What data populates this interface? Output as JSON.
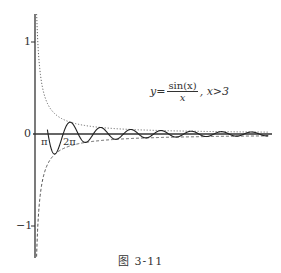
{
  "chart_data": {
    "type": "line",
    "title": "",
    "caption": "图 3-11",
    "annotation": {
      "lhs": "y=",
      "numerator": "sin(x)",
      "denominator": "x",
      "condition": ", x>3"
    },
    "xlabel": "",
    "ylabel": "",
    "y_ticks": [
      "1",
      "0",
      "−1"
    ],
    "x_ticks": [
      "π",
      "2π"
    ],
    "ylim": [
      -1.35,
      1.3
    ],
    "xlim": [
      0,
      49
    ],
    "grid": false,
    "series": [
      {
        "name": "y = sin(x)/x, x>3",
        "style": "solid",
        "x_range": [
          3,
          49
        ]
      },
      {
        "name": "y = 1/x",
        "style": "dotted",
        "x_range": [
          0.75,
          49
        ]
      },
      {
        "name": "y = -1/x",
        "style": "dashed",
        "x_range": [
          0.75,
          49
        ]
      }
    ]
  },
  "labels": {
    "y1": "1",
    "y0": "0",
    "ym1": "−1",
    "pi": "π",
    "two_pi": "2π",
    "caption": "图   3-11",
    "f_lhs": "y=",
    "f_num": "sin(x)",
    "f_den": "x",
    "f_cond": ", x>3"
  }
}
